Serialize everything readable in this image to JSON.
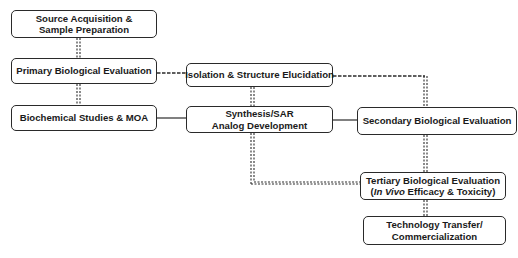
{
  "diagram": {
    "nodes": [
      {
        "id": "source",
        "lines": [
          "Source Acquisition &",
          "Sample Preparation"
        ]
      },
      {
        "id": "primary",
        "lines": [
          "Primary Biological Evaluation"
        ]
      },
      {
        "id": "isolation",
        "lines": [
          "Isolation & Structure Elucidation"
        ]
      },
      {
        "id": "biochem",
        "lines": [
          "Biochemical Studies & MOA"
        ]
      },
      {
        "id": "synthesis",
        "lines": [
          "Synthesis/SAR",
          "Analog Development"
        ]
      },
      {
        "id": "secondary",
        "lines": [
          "Secondary Biological Evaluation"
        ]
      },
      {
        "id": "tertiary",
        "lines": [
          "Tertiary Biological Evaluation",
          "(In Vivo Efficacy & Toxicity)"
        ],
        "italic_part": "In Vivo",
        "line2_prefix": "(",
        "line2_suffix": " Efficacy & Toxicity)"
      },
      {
        "id": "techtransfer",
        "lines": [
          "Technology Transfer/",
          "Commercialization"
        ]
      }
    ],
    "edges": [
      {
        "from": "source",
        "to": "primary",
        "style": "double-dashed"
      },
      {
        "from": "primary",
        "to": "isolation",
        "style": "dashed"
      },
      {
        "from": "primary",
        "to": "biochem",
        "style": "double-dashed"
      },
      {
        "from": "isolation",
        "to": "synthesis",
        "style": "double-dashed"
      },
      {
        "from": "isolation",
        "to": "secondary",
        "style": "dashed"
      },
      {
        "from": "biochem",
        "to": "synthesis",
        "style": "solid"
      },
      {
        "from": "synthesis",
        "to": "secondary",
        "style": "solid"
      },
      {
        "from": "synthesis",
        "to": "tertiary",
        "style": "double-dashed"
      },
      {
        "from": "secondary",
        "to": "tertiary",
        "style": "double-dashed"
      },
      {
        "from": "tertiary",
        "to": "techtransfer",
        "style": "double-dashed"
      }
    ]
  }
}
